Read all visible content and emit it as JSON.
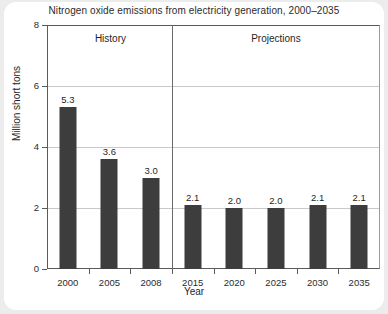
{
  "chart_data": {
    "type": "bar",
    "title": "Nitrogen oxide emissions from electricity generation, 2000–2035",
    "xlabel": "Year",
    "ylabel": "Million short tons",
    "categories": [
      "2000",
      "2005",
      "2008",
      "2015",
      "2020",
      "2025",
      "2030",
      "2035"
    ],
    "values": [
      5.3,
      3.6,
      3.0,
      2.1,
      2.0,
      2.0,
      2.1,
      2.1
    ],
    "value_labels": [
      "5.3",
      "3.6",
      "3.0",
      "2.1",
      "2.0",
      "2.0",
      "2.1",
      "2.1"
    ],
    "ylim": [
      0,
      8
    ],
    "yticks": [
      0,
      2,
      4,
      6,
      8
    ],
    "ytick_labels": [
      "0",
      "2",
      "4",
      "6",
      "8"
    ],
    "grid": "horizontal",
    "legend": "none",
    "annotations": [
      {
        "label": "History",
        "spans": [
          "2000",
          "2005",
          "2008"
        ]
      },
      {
        "label": "Projections",
        "spans": [
          "2015",
          "2020",
          "2025",
          "2030",
          "2035"
        ]
      }
    ],
    "divider_after_category": "2008",
    "bar_color": "#3d3d3d",
    "grid_color": "#c9c9c9",
    "axis_color": "#5a5a5a",
    "background_color": "#ffffff",
    "page_background_color": "#ececed"
  },
  "annotations": {
    "history_label": "History",
    "projections_label": "Projections"
  }
}
